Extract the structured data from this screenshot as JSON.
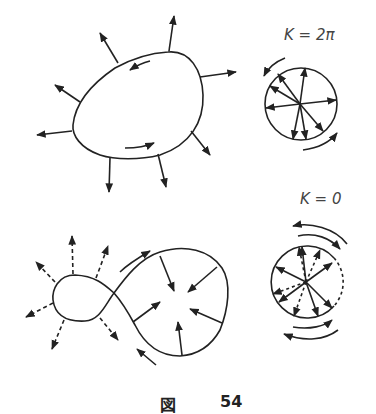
{
  "labels": {
    "top_circle": "K = 2π",
    "bottom_circle": "K = 0"
  },
  "caption": {
    "prefix": "図",
    "number": "54"
  },
  "colors": {
    "ink": "#222222",
    "background": "#ffffff"
  }
}
